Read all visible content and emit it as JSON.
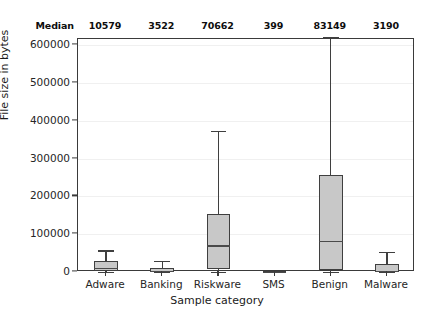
{
  "chart_data": {
    "type": "box",
    "title": "",
    "xlabel": "Sample category",
    "ylabel": "File size in bytes",
    "categories": [
      "Adware",
      "Banking",
      "Riskware",
      "SMS",
      "Benign",
      "Malware"
    ],
    "ylim": [
      0,
      600000
    ],
    "yticks": [
      0,
      100000,
      200000,
      300000,
      400000,
      500000,
      600000
    ],
    "ytick_labels": [
      "0",
      "100000",
      "200000",
      "300000",
      "400000",
      "500000",
      "600000"
    ],
    "grid": true,
    "legend": "none",
    "median_row_label": "Median",
    "medians": [
      10579,
      3522,
      70662,
      399,
      83149,
      3190
    ],
    "median_labels": [
      "10579",
      "3522",
      "70662",
      "399",
      "83149",
      "3190"
    ],
    "boxes": [
      {
        "category": "Adware",
        "whisker_low": 0,
        "q1": 1500,
        "median": 10579,
        "q3": 28000,
        "whisker_high": 57000
      },
      {
        "category": "Banking",
        "whisker_low": 0,
        "q1": 800,
        "median": 3522,
        "q3": 10500,
        "whisker_high": 29000
      },
      {
        "category": "Riskware",
        "whisker_low": 800,
        "q1": 9000,
        "median": 70662,
        "q3": 153000,
        "whisker_high": 374000
      },
      {
        "category": "SMS",
        "whisker_low": 0,
        "q1": 200,
        "median": 399,
        "q3": 1400,
        "whisker_high": 2500
      },
      {
        "category": "Benign",
        "whisker_low": 300,
        "q1": 6000,
        "median": 83149,
        "q3": 256000,
        "whisker_high": 620000
      },
      {
        "category": "Malware",
        "whisker_low": 0,
        "q1": 1000,
        "median": 3190,
        "q3": 20000,
        "whisker_high": 53000
      }
    ],
    "colors": {
      "box_fill": "#c8c8c8",
      "box_edge": "#3f3f3f",
      "median_line": "#4a4a4a",
      "whisker": "#3f3f3f",
      "grid": "#f0f0f0",
      "frame": "#3a3a3a",
      "text": "#1a1a1a",
      "background": "#ffffff"
    }
  }
}
